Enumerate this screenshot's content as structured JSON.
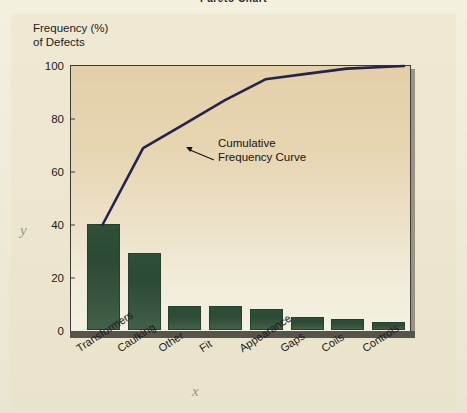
{
  "title": "Pareto Chart",
  "axis_markers": {
    "y": "y",
    "x": "x"
  },
  "annotation": "Cumulative\nFrequency Curve",
  "y_caption": "Frequency (%)\nof Defects",
  "colors": {
    "bar": "#2c4a35",
    "curve": "#232350",
    "plot_bg_top": "#e4cfa8",
    "plot_bg_bottom": "#f4f1e2",
    "page_bg": "#efe9d4",
    "axis": "#3b3b39",
    "baseline": "#57544c"
  },
  "chart_data": {
    "type": "bar",
    "title": "Pareto Chart",
    "xlabel": "",
    "ylabel": "Frequency (%) of Defects",
    "ylim": [
      0,
      100
    ],
    "yticks": [
      0,
      20,
      40,
      60,
      80,
      100
    ],
    "grid": false,
    "legend": null,
    "categories": [
      "Transformers",
      "Caulking",
      "Other",
      "Fit",
      "Appearance",
      "Gaps",
      "Coils",
      "Controls"
    ],
    "values": [
      40,
      29,
      9,
      9,
      8,
      5,
      4,
      3
    ],
    "series": [
      {
        "name": "Frequency (%) of Defects",
        "type": "bar",
        "values": [
          40,
          29,
          9,
          9,
          8,
          5,
          4,
          3
        ]
      },
      {
        "name": "Cumulative Frequency Curve",
        "type": "line",
        "values": [
          40,
          69,
          78,
          87,
          95,
          97,
          99,
          100
        ]
      }
    ],
    "annotations": [
      {
        "text": "Cumulative Frequency Curve",
        "points_to": "cumulative-line"
      }
    ]
  }
}
